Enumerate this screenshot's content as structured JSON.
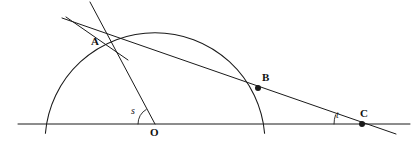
{
  "figure": {
    "kind": "geometry-diagram",
    "background_color": "#ffffff",
    "stroke_color": "#1a1a1a",
    "label_color": "#111111"
  },
  "points": [
    {
      "id": "A",
      "label": "A",
      "x": 100,
      "y": 33,
      "label_x": 91,
      "label_y": 36,
      "dot": false
    },
    {
      "id": "B",
      "label": "B",
      "x": 258,
      "y": 88,
      "label_x": 262,
      "label_y": 72,
      "dot": true
    },
    {
      "id": "C",
      "label": "C",
      "x": 362,
      "y": 124,
      "label_x": 360,
      "label_y": 108,
      "dot": true
    },
    {
      "id": "O",
      "label": "O",
      "x": 155,
      "y": 124,
      "label_x": 150,
      "label_y": 127,
      "dot": false
    }
  ],
  "angles": [
    {
      "id": "s",
      "label": "s",
      "vertex": "O",
      "label_x": 131,
      "label_y": 106,
      "arc_radius": 17
    },
    {
      "id": "t",
      "label": "t",
      "vertex": "C",
      "label_x": 336,
      "label_y": 110,
      "arc_radius": 28
    }
  ],
  "circle": {
    "center_x": 155,
    "center_y": 124,
    "radius": 110,
    "label": "semicircle-arc"
  },
  "lines": [
    {
      "id": "baseline",
      "label": "horizontal-base-line",
      "x1": 18,
      "y1": 124,
      "x2": 410,
      "y2": 124
    },
    {
      "id": "secant",
      "label": "secant-through-A-B-C",
      "x1": 62,
      "y1": 18,
      "x2": 396,
      "y2": 134
    },
    {
      "id": "radius",
      "label": "radius-O-to-A-extended",
      "x1": 90,
      "y1": 2,
      "x2": 155,
      "y2": 124
    },
    {
      "id": "tangent",
      "label": "tangent-at-A",
      "x1": 66,
      "y1": 17,
      "x2": 128,
      "y2": 60
    }
  ]
}
